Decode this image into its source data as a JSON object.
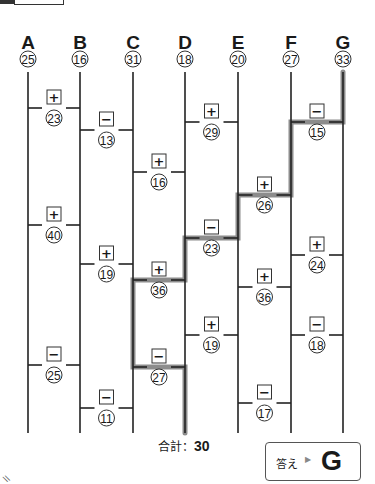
{
  "puzzle": {
    "type": "amidakuji",
    "columns": [
      {
        "label": "A",
        "start": "25",
        "x": 28
      },
      {
        "label": "B",
        "start": "16",
        "x": 80
      },
      {
        "label": "C",
        "start": "31",
        "x": 133
      },
      {
        "label": "D",
        "start": "18",
        "x": 185
      },
      {
        "label": "E",
        "start": "20",
        "x": 238
      },
      {
        "label": "F",
        "start": "27",
        "x": 291
      },
      {
        "label": "G",
        "start": "33",
        "x": 343
      }
    ],
    "rungs": [
      {
        "between": "A-B",
        "op": "+",
        "value": "23",
        "y": 108
      },
      {
        "between": "A-B",
        "op": "+",
        "value": "40",
        "y": 225
      },
      {
        "between": "A-B",
        "op": "−",
        "value": "25",
        "y": 365
      },
      {
        "between": "B-C",
        "op": "−",
        "value": "13",
        "y": 130
      },
      {
        "between": "B-C",
        "op": "+",
        "value": "19",
        "y": 264
      },
      {
        "between": "B-C",
        "op": "−",
        "value": "11",
        "y": 408
      },
      {
        "between": "C-D",
        "op": "+",
        "value": "16",
        "y": 172
      },
      {
        "between": "C-D",
        "op": "+",
        "value": "36",
        "y": 280
      },
      {
        "between": "C-D",
        "op": "−",
        "value": "27",
        "y": 367
      },
      {
        "between": "D-E",
        "op": "+",
        "value": "29",
        "y": 122
      },
      {
        "between": "D-E",
        "op": "−",
        "value": "23",
        "y": 238
      },
      {
        "between": "D-E",
        "op": "+",
        "value": "19",
        "y": 335
      },
      {
        "between": "E-F",
        "op": "+",
        "value": "26",
        "y": 195
      },
      {
        "between": "E-F",
        "op": "+",
        "value": "36",
        "y": 287
      },
      {
        "between": "E-F",
        "op": "−",
        "value": "17",
        "y": 403
      },
      {
        "between": "F-G",
        "op": "−",
        "value": "15",
        "y": 122
      },
      {
        "between": "F-G",
        "op": "+",
        "value": "24",
        "y": 255
      },
      {
        "between": "F-G",
        "op": "−",
        "value": "18",
        "y": 335
      }
    ],
    "highlight_path": "G → F(−15) → E(+26) → D(−23) → C(+36) → D(−27)",
    "highlight_color": "#8a8a8a"
  },
  "total": {
    "label": "合計：",
    "value": "30"
  },
  "answer": {
    "label": "答え",
    "arrow": "▶",
    "value": "G"
  }
}
